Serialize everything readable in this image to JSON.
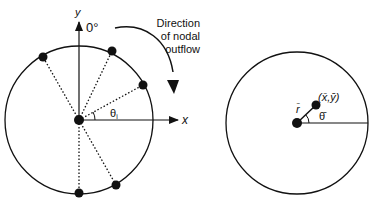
{
  "left_diagram": {
    "y_axis_label": "y",
    "x_axis_label": "x",
    "zero_angle_label": "0°",
    "angle_label": "θ",
    "angle_subscript": "i",
    "flow_caption": [
      "Direction",
      "of nodal",
      "outflow"
    ],
    "nodes": [
      {
        "x": 43,
        "y": 57
      },
      {
        "x": 112,
        "y": 51
      },
      {
        "x": 143,
        "y": 85
      },
      {
        "x": 116,
        "y": 185
      },
      {
        "x": 79,
        "y": 193
      }
    ],
    "center": {
      "x": 79,
      "y": 120
    },
    "radius": 74
  },
  "right_diagram": {
    "centroid_label": "(x̄,ȳ)",
    "radius_label": "r̄",
    "angle_label": "θ̄",
    "center": {
      "x": 297,
      "y": 123
    },
    "radius": 71
  }
}
